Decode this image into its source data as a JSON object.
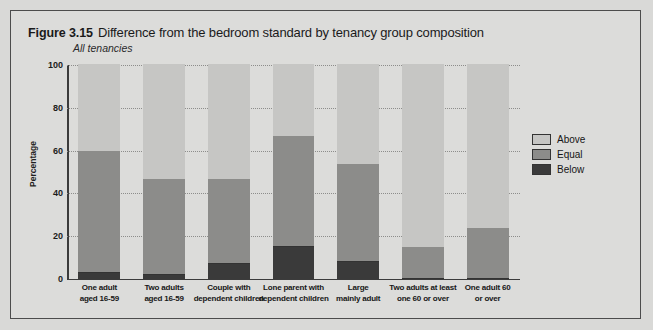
{
  "figure": {
    "number": "Figure 3.15",
    "title": "Difference from the bedroom standard by tenancy group composition",
    "subtitle": "All tenancies"
  },
  "legend": {
    "position": "right",
    "items": [
      {
        "label": "Above",
        "color": "#c6c6c4"
      },
      {
        "label": "Equal",
        "color": "#8c8c8a"
      },
      {
        "label": "Below",
        "color": "#3a3a3a"
      }
    ]
  },
  "axes": {
    "ylabel": "Percentage",
    "yticks": [
      "0",
      "20",
      "40",
      "60",
      "80",
      "100"
    ],
    "ymin": 0,
    "ymax": 100
  },
  "chart_data": {
    "type": "bar",
    "title": "Difference from the bedroom standard by tenancy group composition",
    "subtitle": "All tenancies",
    "xlabel": "",
    "ylabel": "Percentage",
    "ylim": [
      0,
      100
    ],
    "grid": true,
    "stacked": true,
    "legend_position": "right",
    "categories": [
      "One adult aged 16-59",
      "Two adults aged 16-59",
      "Couple with dependent children",
      "Lone parent with dependent children",
      "Large mainly adult",
      "Two adults at least one 60 or over",
      "One adult 60 or over"
    ],
    "category_lines": [
      [
        "One adult",
        "aged 16-59"
      ],
      [
        "Two adults",
        "aged 16-59"
      ],
      [
        "Couple with",
        "dependent children"
      ],
      [
        "Lone parent with",
        "dependent children"
      ],
      [
        "Large",
        "mainly adult"
      ],
      [
        "Two adults at least",
        "one 60 or over"
      ],
      [
        "One adult 60",
        "or over"
      ]
    ],
    "series": [
      {
        "name": "Below",
        "color": "#3a3a3a",
        "values": [
          3,
          2,
          7,
          15,
          8,
          0,
          0
        ]
      },
      {
        "name": "Equal",
        "color": "#8c8c8a",
        "values": [
          57,
          45,
          40,
          52,
          46,
          15,
          24
        ]
      },
      {
        "name": "Above",
        "color": "#c6c6c4",
        "values": [
          40,
          53,
          53,
          33,
          46,
          85,
          76
        ]
      }
    ],
    "cumulative_tops": {
      "below": [
        3,
        2,
        7,
        15,
        8,
        0,
        0
      ],
      "equal": [
        60,
        47,
        47,
        67,
        54,
        15,
        24
      ],
      "above": [
        100,
        100,
        100,
        100,
        100,
        100,
        100
      ]
    }
  }
}
